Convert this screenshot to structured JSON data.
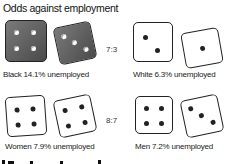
{
  "title": "Odds against employment",
  "pairs": [
    {
      "label": "Black 14.1% unemployed",
      "dice": [
        4,
        3
      ],
      "shade": "dark"
    },
    {
      "label": "White 6.3% unemployed",
      "dice": [
        2,
        1
      ],
      "shade": "light"
    },
    {
      "label": "Women 7.9% unemployed",
      "dice": [
        4,
        4
      ],
      "shade": "light"
    },
    {
      "label": "Men 7.2% unemployed",
      "dice": [
        4,
        3
      ],
      "shade": "light"
    }
  ],
  "ratios": {
    "race": "7:3",
    "gender": "8:7"
  },
  "colors": {
    "dark_die": "#5a5a5a",
    "light_die": "#ffffff",
    "pip_dark": "#222222"
  }
}
